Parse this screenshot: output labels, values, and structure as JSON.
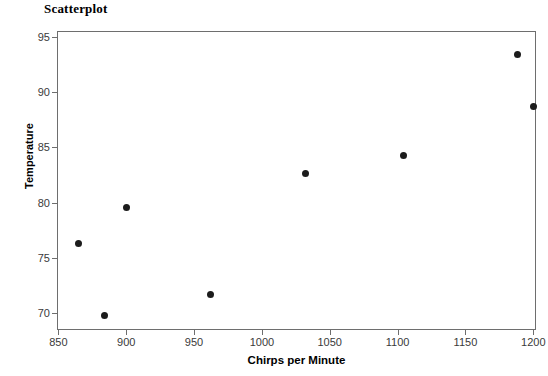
{
  "chart_data": {
    "type": "scatter",
    "title": "Scatterplot",
    "xlabel": "Chirps per Minute",
    "ylabel": "Temperature",
    "xlim": [
      849,
      1202
    ],
    "ylim": [
      68.5,
      95.5
    ],
    "xticks": [
      850,
      900,
      950,
      1000,
      1050,
      1100,
      1150,
      1200
    ],
    "yticks": [
      70,
      75,
      80,
      85,
      90,
      95
    ],
    "grid": false,
    "legend": false,
    "marker_color": "#1c1c1c",
    "points": [
      {
        "x": 865,
        "y": 76.3
      },
      {
        "x": 884,
        "y": 69.8
      },
      {
        "x": 900,
        "y": 79.6
      },
      {
        "x": 962,
        "y": 71.7
      },
      {
        "x": 1032,
        "y": 82.6
      },
      {
        "x": 1104,
        "y": 84.3
      },
      {
        "x": 1188,
        "y": 93.4
      },
      {
        "x": 1200,
        "y": 88.7
      }
    ]
  }
}
